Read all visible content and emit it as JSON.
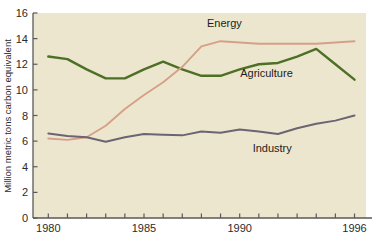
{
  "chart_data": {
    "type": "line",
    "title": "",
    "xlabel": "",
    "ylabel": "Million metric tons carbon equivalent",
    "xlim": [
      1979.2,
      1996.6
    ],
    "ylim": [
      0,
      16
    ],
    "grid": false,
    "legend_position": "inline-annotations",
    "x": [
      1980,
      1981,
      1982,
      1983,
      1984,
      1985,
      1986,
      1987,
      1988,
      1989,
      1990,
      1991,
      1992,
      1993,
      1994,
      1995,
      1996
    ],
    "xticks": [
      1980,
      1981,
      1982,
      1983,
      1984,
      1985,
      1986,
      1987,
      1988,
      1989,
      1990,
      1991,
      1992,
      1993,
      1994,
      1995,
      1996
    ],
    "xticklabels": [
      "1980",
      "",
      "",
      "",
      "",
      "1985",
      "",
      "",
      "",
      "",
      "1990",
      "",
      "",
      "",
      "",
      "",
      "1996"
    ],
    "yticks": [
      0,
      2,
      4,
      6,
      8,
      10,
      12,
      14,
      16
    ],
    "yticklabels": [
      "0",
      "2",
      "4",
      "6",
      "8",
      "10",
      "12",
      "14",
      "16"
    ],
    "series": [
      {
        "name": "Agriculture",
        "color": "#4d7026",
        "values": [
          12.6,
          12.4,
          11.6,
          10.9,
          10.9,
          11.6,
          12.2,
          11.6,
          11.1,
          11.1,
          11.6,
          12.0,
          12.1,
          12.6,
          13.2,
          12.0,
          10.8
        ]
      },
      {
        "name": "Energy",
        "color": "#d6a088",
        "values": [
          6.2,
          6.1,
          6.3,
          7.2,
          8.5,
          9.6,
          10.6,
          11.8,
          13.4,
          13.8,
          13.7,
          13.6,
          13.6,
          13.6,
          13.6,
          13.7,
          13.8
        ]
      },
      {
        "name": "Industry",
        "color": "#6b6472",
        "values": [
          6.6,
          6.4,
          6.3,
          5.95,
          6.3,
          6.55,
          6.5,
          6.45,
          6.75,
          6.65,
          6.9,
          6.75,
          6.55,
          7.0,
          7.35,
          7.6,
          8.0
        ]
      }
    ],
    "annotations": [
      {
        "text": "Energy",
        "x": 1989.2,
        "y": 14.9,
        "color": "#1c1c1c"
      },
      {
        "text": "Agriculture",
        "x": 1991.4,
        "y": 11.0,
        "color": "#1c1c1c"
      },
      {
        "text": "Industry",
        "x": 1991.7,
        "y": 5.15,
        "color": "#1c1c1c"
      }
    ],
    "colors": {
      "plot_background": "#ece6cf",
      "figure_background": "#ffffff",
      "axis": "#595959",
      "text": "#2b2b2b"
    }
  }
}
